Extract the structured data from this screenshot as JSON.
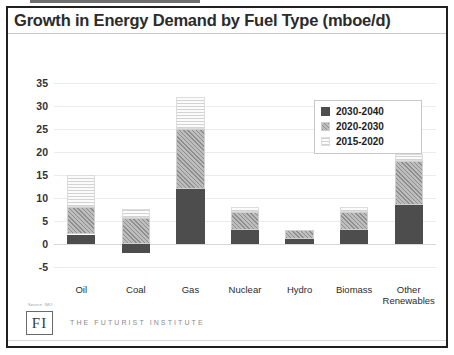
{
  "chart_data": {
    "type": "bar",
    "stacked": true,
    "title": "Growth in Energy Demand by Fuel Type (mboe/d)",
    "xlabel": "",
    "ylabel": "",
    "ylim": [
      -7.5,
      37.5
    ],
    "yticks": [
      35,
      30,
      25,
      20,
      15,
      10,
      5,
      0,
      -5
    ],
    "grid": true,
    "legend_position": "top-right",
    "categories": [
      "Oil",
      "Coal",
      "Gas",
      "Nuclear",
      "Hydro",
      "Biomass",
      "Other\nRenewables"
    ],
    "series": [
      {
        "name": "2030-2040",
        "values": [
          2.0,
          -2.0,
          12.0,
          3.0,
          1.0,
          3.0,
          8.5
        ]
      },
      {
        "name": "2020-2030",
        "values": [
          6.0,
          5.5,
          13.0,
          4.0,
          2.0,
          4.0,
          9.5
        ]
      },
      {
        "name": "2015-2020",
        "values": [
          7.0,
          2.0,
          7.0,
          1.0,
          0.0,
          1.0,
          1.5
        ]
      }
    ]
  },
  "legend": {
    "items": [
      {
        "label": "2030-2040",
        "swatch": "dark"
      },
      {
        "label": "2020-2030",
        "swatch": "mid"
      },
      {
        "label": "2015-2020",
        "swatch": "light"
      }
    ]
  },
  "footer": {
    "source_note": "Source: IMO",
    "logo_text": "FI",
    "org_name": "THE FUTURIST INSTITUTE"
  },
  "colors": {
    "dark": "#4d4d4d",
    "mid": "#a8a8a8",
    "light": "#f2f2f2",
    "frame": "#231f20",
    "gridline": "#eceaea"
  }
}
